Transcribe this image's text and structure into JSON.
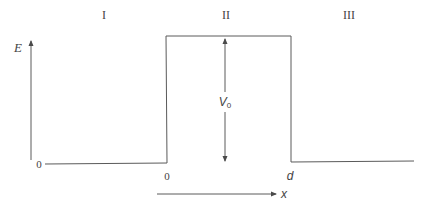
{
  "diagram": {
    "type": "potential-barrier",
    "colors": {
      "line": "#5a5a5a",
      "text": "#444444",
      "background": "#ffffff"
    },
    "regions": [
      {
        "label": "I"
      },
      {
        "label": "II"
      },
      {
        "label": "III"
      }
    ],
    "axis": {
      "energy_label": "E",
      "origin_label": "0",
      "position_label": "x"
    },
    "barrier": {
      "left_edge_label": "0",
      "right_edge_label": "d",
      "height_label_main": "V",
      "height_label_sub": "0"
    }
  }
}
